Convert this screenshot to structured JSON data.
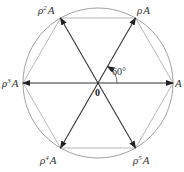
{
  "diagram": {
    "center_label": "0",
    "angle_label": "60°",
    "vertices": [
      {
        "base": "A",
        "sup": "",
        "prefix": ""
      },
      {
        "base": "A",
        "sup": "",
        "prefix": "ρ"
      },
      {
        "base": "A",
        "sup": "2",
        "prefix": "ρ"
      },
      {
        "base": "A",
        "sup": "3",
        "prefix": "ρ"
      },
      {
        "base": "A",
        "sup": "4",
        "prefix": "ρ"
      },
      {
        "base": "A",
        "sup": "5",
        "prefix": "ρ"
      }
    ]
  },
  "colors": {
    "stroke": "#333333",
    "circle": "#888888",
    "hexagon": "#999999"
  }
}
